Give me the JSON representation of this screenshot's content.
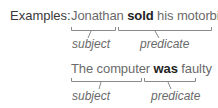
{
  "heading": "Examples:",
  "examples": [
    {
      "before": "Jonathan",
      "verb": "sold",
      "after": "his motorbike",
      "subject_label": "subject",
      "predicate_label": "predicate"
    },
    {
      "before": "The computer",
      "verb": "was",
      "after": "faulty",
      "subject_label": "subject",
      "predicate_label": "predicate"
    }
  ],
  "colors": {
    "text": "#6a6a6a",
    "bold": "#222222",
    "bracket": "#8a8a8a"
  }
}
